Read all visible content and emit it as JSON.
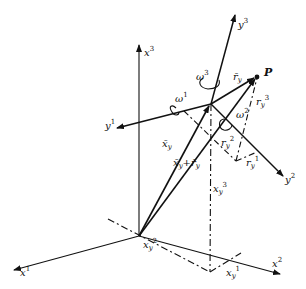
{
  "diagram": {
    "type": "3D coordinate frames with rotating body frame",
    "fixed_axes": [
      {
        "id": "x1",
        "label": "x",
        "index": "1"
      },
      {
        "id": "x2",
        "label": "x",
        "index": "2"
      },
      {
        "id": "x3",
        "label": "x",
        "index": "3"
      }
    ],
    "moving_axes": [
      {
        "id": "y1",
        "label": "y",
        "index": "1"
      },
      {
        "id": "y2",
        "label": "y",
        "index": "2"
      },
      {
        "id": "y3",
        "label": "y",
        "index": "3"
      }
    ],
    "angular_velocities": [
      {
        "id": "omega1",
        "label": "ω",
        "index": "1"
      },
      {
        "id": "omega2",
        "label": "ω",
        "index": "2"
      },
      {
        "id": "omega3",
        "label": "ω",
        "index": "3"
      }
    ],
    "point_label": "P",
    "vectors": {
      "x_bar_y": {
        "base": "x̄",
        "sub": "y"
      },
      "r_bar_y": {
        "base": "r̄",
        "sub": "y"
      },
      "sum": {
        "a": "x̄",
        "a_sub": "y",
        "op": "+",
        "b": "r̄",
        "b_sub": "y"
      }
    },
    "components": {
      "ry1": {
        "base": "r",
        "sub": "y",
        "index": "1"
      },
      "ry2": {
        "base": "r",
        "sub": "y",
        "index": "2"
      },
      "ry3": {
        "base": "r",
        "sub": "y",
        "index": "3"
      },
      "xy1": {
        "base": "x",
        "sub": "y",
        "index": "1"
      },
      "xy2": {
        "base": "x",
        "sub": "y",
        "index": "2"
      },
      "xy3": {
        "base": "x",
        "sub": "y",
        "index": "3"
      }
    }
  }
}
